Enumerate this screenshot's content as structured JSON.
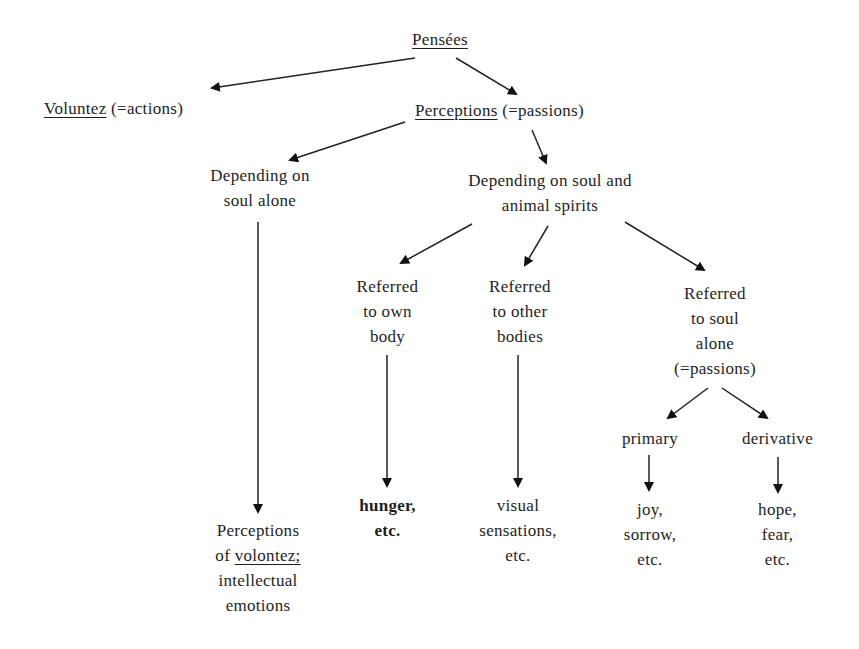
{
  "diagram": {
    "nodes": {
      "pensees": {
        "label": "Pensées"
      },
      "voluntez": {
        "underlined": "Voluntez",
        "rest": " (=actions)"
      },
      "perceptions": {
        "underlined": "Perceptions",
        "rest": " (=passions)"
      },
      "soul_alone": {
        "lines": [
          "Depending on",
          "soul alone"
        ]
      },
      "soul_spirits": {
        "lines": [
          "Depending on soul and",
          "animal spirits"
        ]
      },
      "own_body": {
        "lines": [
          "Referred",
          "to own",
          "body"
        ]
      },
      "other_bodies": {
        "lines": [
          "Referred",
          "to other",
          "bodies"
        ]
      },
      "soul_passions": {
        "lines": [
          "Referred",
          "to soul",
          "alone",
          "(=passions)"
        ]
      },
      "primary": {
        "label": "primary"
      },
      "derivative": {
        "label": "derivative"
      },
      "perceptions_volontez": {
        "line1": "Perceptions",
        "line2_pre": "of ",
        "line2_u": "volontez;",
        "line3": "intellectual",
        "line4": "emotions"
      },
      "hunger": {
        "lines": [
          "hunger,",
          "etc."
        ]
      },
      "visual": {
        "lines": [
          "visual",
          "sensations,",
          "etc."
        ]
      },
      "joy": {
        "lines": [
          "joy,",
          "sorrow,",
          "etc."
        ]
      },
      "hope": {
        "lines": [
          "hope,",
          "fear,",
          "etc."
        ]
      }
    },
    "edges": [
      {
        "from": "pensees",
        "to": "voluntez"
      },
      {
        "from": "pensees",
        "to": "perceptions"
      },
      {
        "from": "perceptions",
        "to": "soul_alone"
      },
      {
        "from": "perceptions",
        "to": "soul_spirits"
      },
      {
        "from": "soul_spirits",
        "to": "own_body"
      },
      {
        "from": "soul_spirits",
        "to": "other_bodies"
      },
      {
        "from": "soul_spirits",
        "to": "soul_passions"
      },
      {
        "from": "soul_alone",
        "to": "perceptions_volontez"
      },
      {
        "from": "own_body",
        "to": "hunger"
      },
      {
        "from": "other_bodies",
        "to": "visual"
      },
      {
        "from": "soul_passions",
        "to": "primary"
      },
      {
        "from": "soul_passions",
        "to": "derivative"
      },
      {
        "from": "primary",
        "to": "joy"
      },
      {
        "from": "derivative",
        "to": "hope"
      }
    ]
  }
}
